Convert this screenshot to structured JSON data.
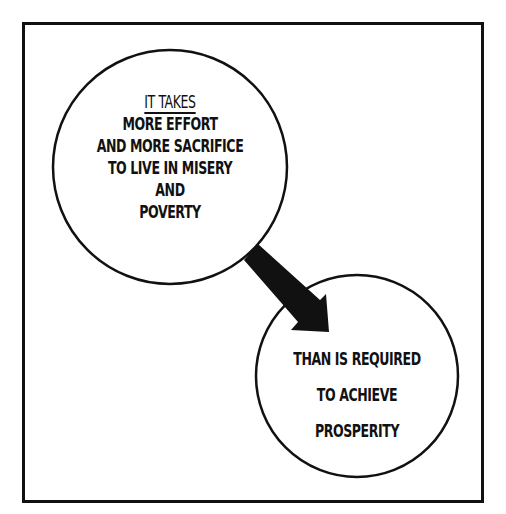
{
  "diagram": {
    "circle_1": {
      "heading": "IT TAKES",
      "lines": [
        "MORE EFFORT",
        "AND MORE SACRIFICE",
        "TO LIVE IN MISERY",
        "AND",
        "POVERTY"
      ]
    },
    "circle_2": {
      "lines": [
        "THAN IS REQUIRED",
        "TO ACHIEVE",
        "PROSPERITY"
      ]
    },
    "arrow": {
      "from": "circle_1",
      "to": "circle_2",
      "icon": "arrow-down-right-icon"
    },
    "colors": {
      "ink": "#111111",
      "background": "#ffffff"
    }
  }
}
